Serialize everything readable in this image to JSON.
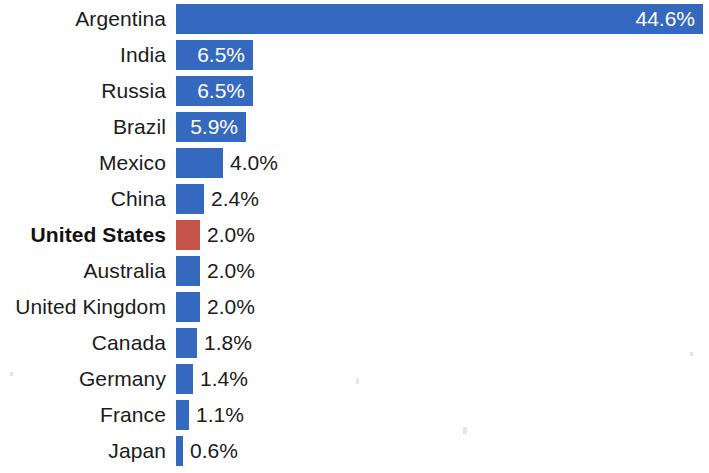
{
  "chart_data": {
    "type": "bar",
    "orientation": "horizontal",
    "title": "",
    "subtitle": "",
    "xlabel": "",
    "ylabel": "",
    "grid": false,
    "legend": null,
    "axis_visible": false,
    "xlim": [
      0,
      44.6
    ],
    "value_suffix": "%",
    "highlight_category": "United States",
    "colors": {
      "bar": "#3569bf",
      "highlight_bar": "#c5544a",
      "label_text": "#1b1b1b",
      "inside_value_text": "#ffffff",
      "background": "#ffffff"
    },
    "categories": [
      "Argentina",
      "India",
      "Russia",
      "Brazil",
      "Mexico",
      "China",
      "United States",
      "Australia",
      "United Kingdom",
      "Canada",
      "Germany",
      "France",
      "Japan"
    ],
    "values": [
      44.6,
      6.5,
      6.5,
      5.9,
      4.0,
      2.4,
      2.0,
      2.0,
      2.0,
      1.8,
      1.4,
      1.1,
      0.6
    ],
    "value_labels": [
      "44.6%",
      "6.5%",
      "6.5%",
      "5.9%",
      "4.0%",
      "2.4%",
      "2.0%",
      "2.0%",
      "2.0%",
      "1.8%",
      "1.4%",
      "1.1%",
      "0.6%"
    ]
  },
  "rows": [
    {
      "label": "Argentina",
      "value": 44.6,
      "value_label": "44.6%",
      "label_inside": true,
      "highlight": false
    },
    {
      "label": "India",
      "value": 6.5,
      "value_label": "6.5%",
      "label_inside": true,
      "highlight": false
    },
    {
      "label": "Russia",
      "value": 6.5,
      "value_label": "6.5%",
      "label_inside": true,
      "highlight": false
    },
    {
      "label": "Brazil",
      "value": 5.9,
      "value_label": "5.9%",
      "label_inside": true,
      "highlight": false
    },
    {
      "label": "Mexico",
      "value": 4.0,
      "value_label": "4.0%",
      "label_inside": false,
      "highlight": false
    },
    {
      "label": "China",
      "value": 2.4,
      "value_label": "2.4%",
      "label_inside": false,
      "highlight": false
    },
    {
      "label": "United States",
      "value": 2.0,
      "value_label": "2.0%",
      "label_inside": false,
      "highlight": true
    },
    {
      "label": "Australia",
      "value": 2.0,
      "value_label": "2.0%",
      "label_inside": false,
      "highlight": false
    },
    {
      "label": "United Kingdom",
      "value": 2.0,
      "value_label": "2.0%",
      "label_inside": false,
      "highlight": false
    },
    {
      "label": "Canada",
      "value": 1.8,
      "value_label": "1.8%",
      "label_inside": false,
      "highlight": false
    },
    {
      "label": "Germany",
      "value": 1.4,
      "value_label": "1.4%",
      "label_inside": false,
      "highlight": false
    },
    {
      "label": "France",
      "value": 1.1,
      "value_label": "1.1%",
      "label_inside": false,
      "highlight": false
    },
    {
      "label": "Japan",
      "value": 0.6,
      "value_label": "0.6%",
      "label_inside": false,
      "highlight": false
    }
  ],
  "layout": {
    "bar_origin_x": 176,
    "px_per_unit": 11.82,
    "row_pitch": 36,
    "row_top": 4,
    "bar_height": 30
  }
}
